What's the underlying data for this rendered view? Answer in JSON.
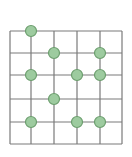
{
  "diagram": {
    "type": "grid-with-nodes",
    "grid": {
      "columns": 5,
      "rows": 5,
      "x_lines": [
        10,
        31,
        54,
        77,
        100,
        122
      ],
      "y_lines": [
        31,
        53,
        75,
        99,
        122,
        144
      ],
      "line_color": "#7a7a7a"
    },
    "node_style": {
      "radius": 5.5,
      "fill": "#9dcb9f",
      "stroke": "#6c9e6e"
    },
    "nodes": [
      {
        "col": 1,
        "row": 0
      },
      {
        "col": 2,
        "row": 1
      },
      {
        "col": 4,
        "row": 1
      },
      {
        "col": 1,
        "row": 2
      },
      {
        "col": 3,
        "row": 2
      },
      {
        "col": 4,
        "row": 2
      },
      {
        "col": 2,
        "row": 3
      },
      {
        "col": 1,
        "row": 4
      },
      {
        "col": 3,
        "row": 4
      },
      {
        "col": 4,
        "row": 4
      }
    ]
  }
}
